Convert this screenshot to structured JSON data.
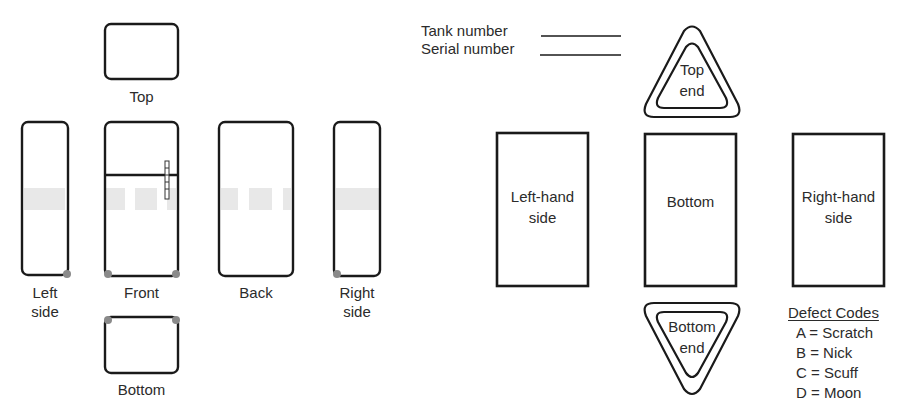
{
  "figure": {
    "left_panel": {
      "description": "Refrigerator unfolded views",
      "views": [
        {
          "id": "top",
          "label": "Top"
        },
        {
          "id": "left-side",
          "label_line1": "Left",
          "label_line2": "side"
        },
        {
          "id": "front",
          "label": "Front"
        },
        {
          "id": "back",
          "label": "Back"
        },
        {
          "id": "right-side",
          "label_line1": "Right",
          "label_line2": "side"
        },
        {
          "id": "bottom",
          "label": "Bottom"
        }
      ]
    },
    "right_panel": {
      "description": "Tank unfolded views",
      "fields": {
        "tank_number": "Tank number",
        "serial_number": "Serial number"
      },
      "views": {
        "top_end": {
          "line1": "Top",
          "line2": "end"
        },
        "left_hand_side": {
          "line1": "Left-hand",
          "line2": "side"
        },
        "bottom": {
          "line1": "Bottom"
        },
        "right_hand_side": {
          "line1": "Right-hand",
          "line2": "side"
        },
        "bottom_end": {
          "line1": "Bottom",
          "line2": "end"
        }
      },
      "legend": {
        "title": "Defect Codes",
        "items": [
          {
            "code": "A",
            "meaning": "Scratch",
            "text": "A = Scratch"
          },
          {
            "code": "B",
            "meaning": "Nick",
            "text": "B = Nick"
          },
          {
            "code": "C",
            "meaning": "Scuff",
            "text": "C = Scuff"
          },
          {
            "code": "D",
            "meaning": "Moon",
            "text": "D = Moon"
          }
        ]
      }
    },
    "colors": {
      "stroke": "#1a1a1a",
      "text": "#2b2b2b",
      "marker": "#8a8a8a",
      "band": "#e2e2e2"
    }
  }
}
